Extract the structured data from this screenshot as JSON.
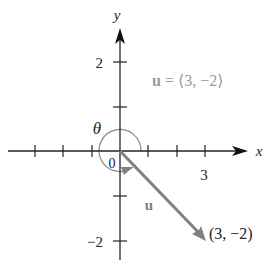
{
  "diagram": {
    "axes": {
      "x_label": "x",
      "y_label": "y",
      "origin_label": "0",
      "x_tick_label": "3",
      "y_tick_labels": {
        "pos": "2",
        "neg": "−2"
      },
      "x_ticks": [
        -4,
        -3,
        -2,
        -1,
        1,
        2,
        3
      ],
      "y_ticks": [
        -2,
        -1,
        1,
        2
      ]
    },
    "vector": {
      "name": "u",
      "components": [
        3,
        -2
      ],
      "endpoint_label": "(3, −2)",
      "equation_bold": "u",
      "equation_rest": " = ⟨3, −2⟩",
      "color": "#808080"
    },
    "angle": {
      "label": "θ"
    },
    "colors": {
      "axis": "#222222",
      "vector": "#808080",
      "angle_arc": "#8a8a8a",
      "equation_text": "#9a9a9a",
      "label_text": "#222222"
    }
  }
}
